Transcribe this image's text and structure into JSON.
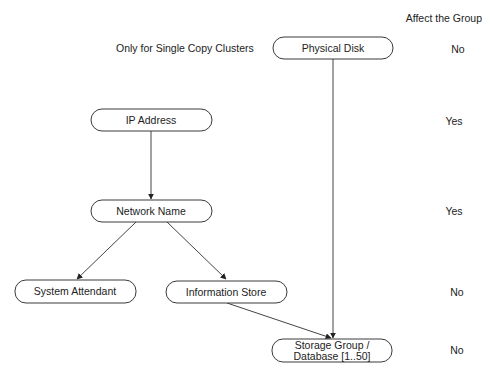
{
  "header": {
    "column_title": "Affect the Group"
  },
  "annotations": {
    "physical_disk_note": "Only for Single Copy Clusters"
  },
  "nodes": [
    {
      "id": "physical-disk",
      "label": "Physical Disk",
      "affects_group": "No"
    },
    {
      "id": "ip-address",
      "label": "IP Address",
      "affects_group": "Yes"
    },
    {
      "id": "network-name",
      "label": "Network Name",
      "affects_group": "Yes"
    },
    {
      "id": "system-attendant",
      "label": "System Attendant",
      "affects_group": "No"
    },
    {
      "id": "information-store",
      "label": "Information Store",
      "affects_group": "No"
    },
    {
      "id": "storage-group",
      "label_line1": "Storage Group /",
      "label_line2": "Database [1..50]",
      "affects_group": "No"
    }
  ],
  "edges": [
    {
      "from": "ip-address",
      "to": "network-name"
    },
    {
      "from": "network-name",
      "to": "system-attendant"
    },
    {
      "from": "network-name",
      "to": "information-store"
    },
    {
      "from": "information-store",
      "to": "storage-group"
    },
    {
      "from": "physical-disk",
      "to": "storage-group"
    }
  ],
  "affect_column": [
    "No",
    "Yes",
    "Yes",
    "No",
    "No"
  ]
}
